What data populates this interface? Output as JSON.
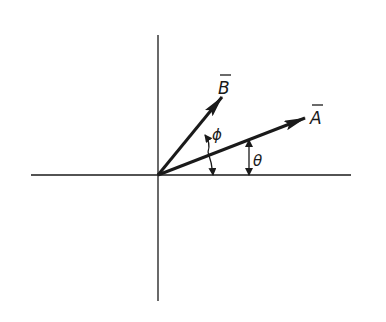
{
  "diagram": {
    "type": "vector-diagram",
    "stroke_color": "#1a1a1a",
    "background": "#ffffff",
    "origin": [
      158,
      175
    ],
    "axes": {
      "horizontal": {
        "x1": 31,
        "x2": 351,
        "y": 175
      },
      "vertical": {
        "x": 158,
        "y1": 35,
        "y2": 301
      }
    },
    "vectors": [
      {
        "name": "A",
        "label": "A",
        "tip": [
          305,
          118
        ],
        "label_pos": [
          318,
          124
        ]
      },
      {
        "name": "B",
        "label": "B",
        "tip": [
          222,
          97
        ],
        "label_pos": [
          222,
          94
        ]
      }
    ],
    "angles": [
      {
        "name": "theta",
        "label": "θ",
        "label_pos": [
          255,
          166
        ]
      },
      {
        "name": "phi",
        "label": "ϕ",
        "label_pos": [
          214,
          140
        ]
      }
    ]
  }
}
